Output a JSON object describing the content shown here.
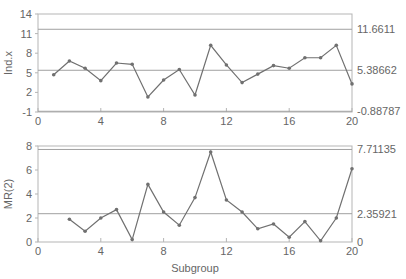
{
  "chart_data": [
    {
      "type": "line",
      "title": "",
      "xlabel": "",
      "ylabel": "Ind.x",
      "xlim": [
        0,
        20
      ],
      "ylim": [
        -1,
        14
      ],
      "x_ticks": [
        0,
        4,
        8,
        12,
        16,
        20
      ],
      "y_ticks": [
        -1,
        2,
        5,
        8,
        11,
        14
      ],
      "grid": false,
      "control_limits": {
        "UCL": 11.6611,
        "CL": 5.38662,
        "LCL": -0.88787
      },
      "right_labels": [
        "11.6611",
        "5.38662",
        "-0.88787"
      ],
      "x": [
        1,
        2,
        3,
        4,
        5,
        6,
        7,
        8,
        9,
        10,
        11,
        12,
        13,
        14,
        15,
        16,
        17,
        18,
        19,
        20
      ],
      "series": [
        {
          "name": "Ind.x",
          "values": [
            4.7,
            6.8,
            5.7,
            3.8,
            6.5,
            6.3,
            1.3,
            3.9,
            5.5,
            1.6,
            9.2,
            6.2,
            3.5,
            4.8,
            6.1,
            5.7,
            7.3,
            7.3,
            9.2,
            3.3
          ]
        }
      ]
    },
    {
      "type": "line",
      "title": "",
      "xlabel": "Subgroup",
      "ylabel": "MR(2)",
      "xlim": [
        0,
        20
      ],
      "ylim": [
        0,
        8
      ],
      "x_ticks": [
        0,
        4,
        8,
        12,
        16,
        20
      ],
      "y_ticks": [
        0,
        2,
        4,
        6,
        8
      ],
      "grid": false,
      "control_limits": {
        "UCL": 7.71135,
        "CL": 2.35921,
        "LCL": 0
      },
      "right_labels": [
        "7.71135",
        "2.35921",
        "0"
      ],
      "x": [
        2,
        3,
        4,
        5,
        6,
        7,
        8,
        9,
        10,
        11,
        12,
        13,
        14,
        15,
        16,
        17,
        18,
        19,
        20
      ],
      "series": [
        {
          "name": "MR(2)",
          "values": [
            1.9,
            0.9,
            2.0,
            2.7,
            0.2,
            4.8,
            2.5,
            1.4,
            3.7,
            7.5,
            3.5,
            2.5,
            1.1,
            1.5,
            0.4,
            1.7,
            0.1,
            2.0,
            6.1
          ]
        }
      ]
    }
  ],
  "colors": {
    "frame": "#b5b5b5",
    "limit_line": "#a0a0a0",
    "series_line": "#707070",
    "marker": "#707070",
    "text": "#666666"
  }
}
